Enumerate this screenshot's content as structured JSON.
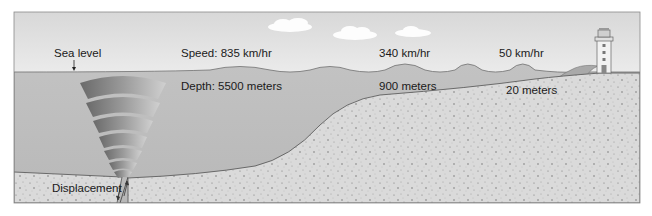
{
  "diagram": {
    "labels": {
      "sea_level": "Sea level",
      "displacement": "Displacement"
    },
    "stages": [
      {
        "speed": "Speed: 835 km/hr",
        "depth": "Depth: 5500 meters"
      },
      {
        "speed": "340 km/hr",
        "depth": "900 meters"
      },
      {
        "speed": "50 km/hr",
        "depth": "20 meters"
      }
    ],
    "icons": [
      "cloud-icon",
      "lighthouse-icon",
      "breaking-wave-icon",
      "fault-arrow-icon"
    ],
    "colors": {
      "sky": "#e6e6e6",
      "water": "#bcbcbc",
      "sediment": "#d9d9d9",
      "outline": "#6b6b6b",
      "wave": "#a9a9a9"
    }
  }
}
